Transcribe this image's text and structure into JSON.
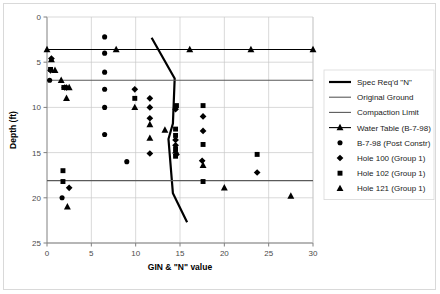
{
  "chart_data": {
    "type": "scatter",
    "title": "",
    "xlabel": "GIN & \"N\" value",
    "ylabel": "Depth (ft)",
    "xlim": [
      0,
      30
    ],
    "ylim": [
      0,
      25
    ],
    "y_inverted": true,
    "xticks": [
      0,
      5,
      10,
      15,
      20,
      25,
      30
    ],
    "yticks": [
      0,
      5,
      10,
      15,
      20,
      25
    ],
    "grid": true,
    "legend_position": "right",
    "series": [
      {
        "name": "Spec Req'd \"N\"",
        "type": "line",
        "marker": "none",
        "linewidth": 2.2,
        "color": "#000000",
        "points": [
          [
            11.8,
            2.3
          ],
          [
            14.4,
            6.8
          ],
          [
            14.2,
            11.8
          ],
          [
            13.7,
            13.5
          ],
          [
            14.2,
            19.5
          ],
          [
            15.8,
            22.7
          ]
        ]
      },
      {
        "name": "Original Ground",
        "type": "hline",
        "marker": "none",
        "linewidth": 1.1,
        "color": "#5a5a5a",
        "y": 7.0,
        "points": [
          [
            0,
            7.0
          ],
          [
            30,
            7.0
          ]
        ]
      },
      {
        "name": "Compaction Limit",
        "type": "hline",
        "marker": "none",
        "linewidth": 1.1,
        "color": "#5a5a5a",
        "y": 18.1,
        "points": [
          [
            0,
            18.1
          ],
          [
            30,
            18.1
          ]
        ]
      },
      {
        "name": "Water Table (B-7-98)",
        "type": "line",
        "marker": "triangle",
        "linewidth": 1.1,
        "color": "#000000",
        "y": 3.6,
        "points": [
          [
            0,
            3.6
          ],
          [
            7.8,
            3.6
          ],
          [
            16.1,
            3.6
          ],
          [
            23.0,
            3.6
          ],
          [
            30.0,
            3.6
          ]
        ]
      },
      {
        "name": "B-7-98 (Post Constr)",
        "type": "scatter",
        "marker": "circle",
        "color": "#000000",
        "points": [
          [
            6.5,
            2.2
          ],
          [
            6.5,
            4.0
          ],
          [
            6.5,
            6.1
          ],
          [
            0.3,
            7.0
          ],
          [
            6.5,
            8.0
          ],
          [
            6.5,
            10.0
          ],
          [
            6.5,
            13.0
          ],
          [
            9.0,
            16.0
          ],
          [
            1.7,
            20.0
          ]
        ]
      },
      {
        "name": "Hole 100 (Group 1)",
        "type": "scatter",
        "marker": "diamond",
        "color": "#000000",
        "points": [
          [
            0.5,
            4.6
          ],
          [
            0.4,
            5.9
          ],
          [
            2.0,
            7.8
          ],
          [
            2.2,
            7.8
          ],
          [
            9.9,
            8.0
          ],
          [
            11.6,
            9.0
          ],
          [
            11.6,
            10.0
          ],
          [
            11.6,
            11.2
          ],
          [
            14.5,
            10.2
          ],
          [
            14.5,
            13.6
          ],
          [
            14.5,
            14.2
          ],
          [
            11.6,
            15.1
          ],
          [
            14.6,
            15.2
          ],
          [
            17.5,
            15.9
          ],
          [
            17.6,
            11.0
          ],
          [
            17.6,
            12.6
          ],
          [
            23.7,
            17.2
          ],
          [
            2.5,
            18.9
          ]
        ]
      },
      {
        "name": "Hole 102 (Group 1)",
        "type": "scatter",
        "marker": "square",
        "color": "#000000",
        "points": [
          [
            0.4,
            5.8
          ],
          [
            1.9,
            7.8
          ],
          [
            9.9,
            9.0
          ],
          [
            14.6,
            9.8
          ],
          [
            14.5,
            12.4
          ],
          [
            14.5,
            13.1
          ],
          [
            14.5,
            14.6
          ],
          [
            14.5,
            15.4
          ],
          [
            17.6,
            9.8
          ],
          [
            17.6,
            14.1
          ],
          [
            17.6,
            18.2
          ],
          [
            23.7,
            15.2
          ],
          [
            1.8,
            17.0
          ],
          [
            1.8,
            18.2
          ]
        ]
      },
      {
        "name": "Hole 121 (Group 1)",
        "type": "scatter",
        "marker": "triangle",
        "color": "#000000",
        "points": [
          [
            0.5,
            4.7
          ],
          [
            0.9,
            5.9
          ],
          [
            1.6,
            7.0
          ],
          [
            2.5,
            7.8
          ],
          [
            2.2,
            9.0
          ],
          [
            9.9,
            10.0
          ],
          [
            11.6,
            11.9
          ],
          [
            11.6,
            13.4
          ],
          [
            13.3,
            12.5
          ],
          [
            14.5,
            14.8
          ],
          [
            17.6,
            16.4
          ],
          [
            20.0,
            18.9
          ],
          [
            27.5,
            19.8
          ],
          [
            2.3,
            21.0
          ]
        ]
      }
    ],
    "legend_entries": [
      {
        "label": "Spec Req'd \"N\"",
        "kind": "line-thick",
        "marker": "none"
      },
      {
        "label": "Original Ground",
        "kind": "line-thin",
        "marker": "none"
      },
      {
        "label": "Compaction Limit",
        "kind": "line-thin",
        "marker": "none"
      },
      {
        "label": "Water Table (B-7-98)",
        "kind": "line-marker",
        "marker": "triangle"
      },
      {
        "label": "B-7-98 (Post Constr)",
        "kind": "marker",
        "marker": "circle"
      },
      {
        "label": "Hole 100 (Group 1)",
        "kind": "marker",
        "marker": "diamond"
      },
      {
        "label": "Hole 102 (Group 1)",
        "kind": "marker",
        "marker": "square"
      },
      {
        "label": "Hole 121 (Group 1)",
        "kind": "marker",
        "marker": "triangle"
      }
    ]
  },
  "colors": {
    "axis": "#808080",
    "grid": "#c8c8c8",
    "plot_line": "#000000",
    "reference_line": "#5a5a5a",
    "marker": "#000000",
    "border": "#d9d9d9",
    "background": "#ffffff"
  }
}
